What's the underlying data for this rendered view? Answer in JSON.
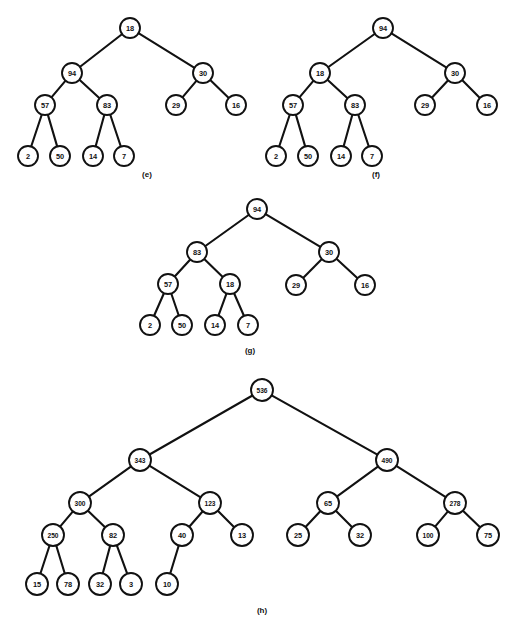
{
  "figure": {
    "background_color": "#ffffff",
    "ink_color": "#111111",
    "node_fill": "#ffffff"
  },
  "chart_data": {
    "type": "diagram",
    "subtype": "binary-tree-set",
    "panels": [
      {
        "id": "e",
        "caption": "(e)",
        "caption_x": 147,
        "caption_y": 174,
        "node_radius": 10,
        "nodes": [
          {
            "id": "e0",
            "label": "18",
            "x": 130,
            "y": 28
          },
          {
            "id": "e1",
            "label": "94",
            "x": 72,
            "y": 73
          },
          {
            "id": "e2",
            "label": "30",
            "x": 203,
            "y": 73
          },
          {
            "id": "e3",
            "label": "57",
            "x": 45,
            "y": 105
          },
          {
            "id": "e4",
            "label": "83",
            "x": 107,
            "y": 105
          },
          {
            "id": "e5",
            "label": "29",
            "x": 176,
            "y": 105
          },
          {
            "id": "e6",
            "label": "16",
            "x": 236,
            "y": 105
          },
          {
            "id": "e7",
            "label": "2",
            "x": 28,
            "y": 156
          },
          {
            "id": "e8",
            "label": "50",
            "x": 60,
            "y": 156
          },
          {
            "id": "e9",
            "label": "14",
            "x": 93,
            "y": 156
          },
          {
            "id": "e10",
            "label": "7",
            "x": 124,
            "y": 156
          }
        ],
        "edges": [
          [
            "e0",
            "e1"
          ],
          [
            "e0",
            "e2"
          ],
          [
            "e1",
            "e3"
          ],
          [
            "e1",
            "e4"
          ],
          [
            "e2",
            "e5"
          ],
          [
            "e2",
            "e6"
          ],
          [
            "e3",
            "e7"
          ],
          [
            "e3",
            "e8"
          ],
          [
            "e4",
            "e9"
          ],
          [
            "e4",
            "e10"
          ]
        ]
      },
      {
        "id": "f",
        "caption": "(f)",
        "caption_x": 376,
        "caption_y": 174,
        "node_radius": 10,
        "nodes": [
          {
            "id": "f0",
            "label": "94",
            "x": 383,
            "y": 28
          },
          {
            "id": "f1",
            "label": "18",
            "x": 320,
            "y": 73
          },
          {
            "id": "f2",
            "label": "30",
            "x": 455,
            "y": 73
          },
          {
            "id": "f3",
            "label": "57",
            "x": 293,
            "y": 105
          },
          {
            "id": "f4",
            "label": "83",
            "x": 355,
            "y": 105
          },
          {
            "id": "f5",
            "label": "29",
            "x": 425,
            "y": 105
          },
          {
            "id": "f6",
            "label": "16",
            "x": 487,
            "y": 105
          },
          {
            "id": "f7",
            "label": "2",
            "x": 276,
            "y": 156
          },
          {
            "id": "f8",
            "label": "50",
            "x": 308,
            "y": 156
          },
          {
            "id": "f9",
            "label": "14",
            "x": 341,
            "y": 156
          },
          {
            "id": "f10",
            "label": "7",
            "x": 372,
            "y": 156
          }
        ],
        "edges": [
          [
            "f0",
            "f1"
          ],
          [
            "f0",
            "f2"
          ],
          [
            "f1",
            "f3"
          ],
          [
            "f1",
            "f4"
          ],
          [
            "f2",
            "f5"
          ],
          [
            "f2",
            "f6"
          ],
          [
            "f3",
            "f7"
          ],
          [
            "f3",
            "f8"
          ],
          [
            "f4",
            "f9"
          ],
          [
            "f4",
            "f10"
          ]
        ]
      },
      {
        "id": "g",
        "caption": "(g)",
        "caption_x": 250,
        "caption_y": 350,
        "node_radius": 10,
        "nodes": [
          {
            "id": "g0",
            "label": "94",
            "x": 257,
            "y": 209
          },
          {
            "id": "g1",
            "label": "83",
            "x": 197,
            "y": 252
          },
          {
            "id": "g2",
            "label": "30",
            "x": 329,
            "y": 252
          },
          {
            "id": "g3",
            "label": "57",
            "x": 168,
            "y": 284
          },
          {
            "id": "g4",
            "label": "18",
            "x": 230,
            "y": 284
          },
          {
            "id": "g5",
            "label": "29",
            "x": 296,
            "y": 285
          },
          {
            "id": "g6",
            "label": "16",
            "x": 365,
            "y": 285
          },
          {
            "id": "g7",
            "label": "2",
            "x": 150,
            "y": 325
          },
          {
            "id": "g8",
            "label": "50",
            "x": 182,
            "y": 325
          },
          {
            "id": "g9",
            "label": "14",
            "x": 215,
            "y": 325
          },
          {
            "id": "g10",
            "label": "7",
            "x": 248,
            "y": 325
          }
        ],
        "edges": [
          [
            "g0",
            "g1"
          ],
          [
            "g0",
            "g2"
          ],
          [
            "g1",
            "g3"
          ],
          [
            "g1",
            "g4"
          ],
          [
            "g2",
            "g5"
          ],
          [
            "g2",
            "g6"
          ],
          [
            "g3",
            "g7"
          ],
          [
            "g3",
            "g8"
          ],
          [
            "g4",
            "g9"
          ],
          [
            "g4",
            "g10"
          ]
        ]
      },
      {
        "id": "h",
        "caption": "(h)",
        "caption_x": 262,
        "caption_y": 610,
        "node_radius": 11,
        "nodes": [
          {
            "id": "h0",
            "label": "536",
            "x": 262,
            "y": 390
          },
          {
            "id": "h1",
            "label": "343",
            "x": 140,
            "y": 460
          },
          {
            "id": "h2",
            "label": "490",
            "x": 387,
            "y": 460
          },
          {
            "id": "h3",
            "label": "300",
            "x": 80,
            "y": 503
          },
          {
            "id": "h4",
            "label": "123",
            "x": 210,
            "y": 503
          },
          {
            "id": "h5",
            "label": "65",
            "x": 328,
            "y": 503
          },
          {
            "id": "h6",
            "label": "278",
            "x": 455,
            "y": 503
          },
          {
            "id": "h7",
            "label": "250",
            "x": 53,
            "y": 535
          },
          {
            "id": "h8",
            "label": "82",
            "x": 113,
            "y": 535
          },
          {
            "id": "h9",
            "label": "40",
            "x": 182,
            "y": 535
          },
          {
            "id": "h10",
            "label": "13",
            "x": 242,
            "y": 535
          },
          {
            "id": "h11",
            "label": "25",
            "x": 298,
            "y": 535
          },
          {
            "id": "h12",
            "label": "32",
            "x": 360,
            "y": 535
          },
          {
            "id": "h13",
            "label": "100",
            "x": 428,
            "y": 535
          },
          {
            "id": "h14",
            "label": "75",
            "x": 488,
            "y": 535
          },
          {
            "id": "h15",
            "label": "15",
            "x": 37,
            "y": 584
          },
          {
            "id": "h16",
            "label": "78",
            "x": 68,
            "y": 584
          },
          {
            "id": "h17",
            "label": "32",
            "x": 100,
            "y": 584
          },
          {
            "id": "h18",
            "label": "3",
            "x": 131,
            "y": 584
          },
          {
            "id": "h19",
            "label": "10",
            "x": 167,
            "y": 584
          }
        ],
        "edges": [
          [
            "h0",
            "h1"
          ],
          [
            "h0",
            "h2"
          ],
          [
            "h1",
            "h3"
          ],
          [
            "h1",
            "h4"
          ],
          [
            "h2",
            "h5"
          ],
          [
            "h2",
            "h6"
          ],
          [
            "h3",
            "h7"
          ],
          [
            "h3",
            "h8"
          ],
          [
            "h4",
            "h9"
          ],
          [
            "h4",
            "h10"
          ],
          [
            "h5",
            "h11"
          ],
          [
            "h5",
            "h12"
          ],
          [
            "h6",
            "h13"
          ],
          [
            "h6",
            "h14"
          ],
          [
            "h7",
            "h15"
          ],
          [
            "h7",
            "h16"
          ],
          [
            "h8",
            "h17"
          ],
          [
            "h8",
            "h18"
          ],
          [
            "h9",
            "h19"
          ]
        ]
      }
    ]
  }
}
